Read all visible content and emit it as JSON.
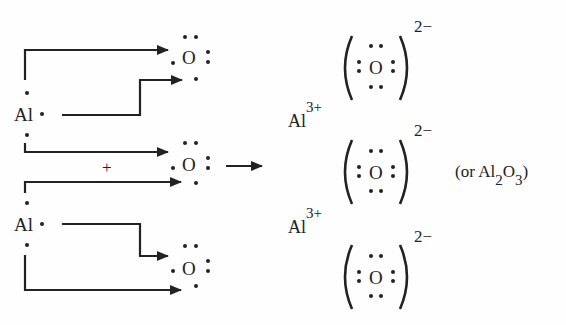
{
  "diagram": {
    "reactants": {
      "aluminum_atoms": [
        {
          "symbol": "Al",
          "valence_electrons": 3
        },
        {
          "symbol": "Al",
          "valence_electrons": 3
        }
      ],
      "oxygen_atoms": [
        {
          "symbol": "O",
          "valence_electrons": 6
        },
        {
          "symbol": "O",
          "valence_electrons": 6
        },
        {
          "symbol": "O",
          "valence_electrons": 6
        }
      ],
      "plus_sign": "+"
    },
    "reaction_arrow": "→",
    "products": {
      "cations": [
        {
          "symbol": "Al",
          "charge": "3+"
        },
        {
          "symbol": "Al",
          "charge": "3+"
        }
      ],
      "anions": [
        {
          "symbol": "O",
          "charge": "2−"
        },
        {
          "symbol": "O",
          "charge": "2−"
        },
        {
          "symbol": "O",
          "charge": "2−"
        }
      ]
    },
    "formula_note": {
      "prefix": "(or Al",
      "sub1": "2",
      "mid": "O",
      "sub2": "3",
      "suffix": ")"
    },
    "colors": {
      "ink": "#222222",
      "background": "#fefefe"
    }
  }
}
